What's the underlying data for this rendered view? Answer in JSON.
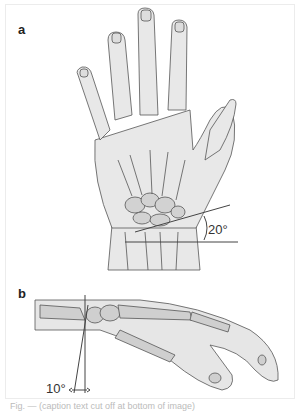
{
  "figure": {
    "panels": [
      {
        "label": "a",
        "view": "dorsal view of hand and wrist",
        "angle_label": "20°"
      },
      {
        "label": "b",
        "view": "lateral view of hand and wrist",
        "angle_label": "10°"
      }
    ],
    "caption": "Fig. — (caption text cut off at bottom of image)"
  },
  "colors": {
    "skin_fill": "#e6e6e6",
    "bone_fill": "#cfcfcf",
    "outline": "#444444",
    "border": "#ececec"
  }
}
